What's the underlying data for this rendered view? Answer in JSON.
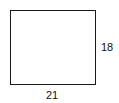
{
  "diagram": {
    "shape": "rectangle",
    "height_label": "18",
    "width_label": "21",
    "stroke_color": "#1a1a1a"
  }
}
